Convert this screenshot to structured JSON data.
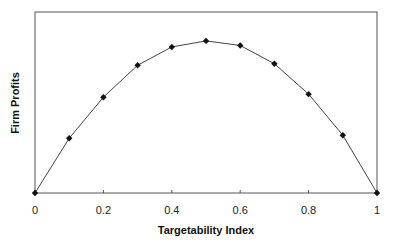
{
  "chart_data": {
    "type": "line",
    "title": "",
    "xlabel": "Targetability Index",
    "ylabel": "Firm Profits",
    "xlim": [
      0,
      1
    ],
    "ylim": [
      0,
      1.19
    ],
    "x_ticks": [
      "0",
      "0.2",
      "0.4",
      "0.6",
      "0.8",
      "1"
    ],
    "y_ticks": [],
    "grid": false,
    "legend": null,
    "series": [
      {
        "name": "Firm Profits",
        "marker": "diamond",
        "color": "#222222",
        "x": [
          0,
          0.1,
          0.2,
          0.3,
          0.4,
          0.5,
          0.6,
          0.7,
          0.8,
          0.9,
          1.0
        ],
        "y": [
          0,
          0.36,
          0.63,
          0.84,
          0.96,
          1.0,
          0.97,
          0.85,
          0.65,
          0.38,
          0
        ]
      }
    ]
  }
}
